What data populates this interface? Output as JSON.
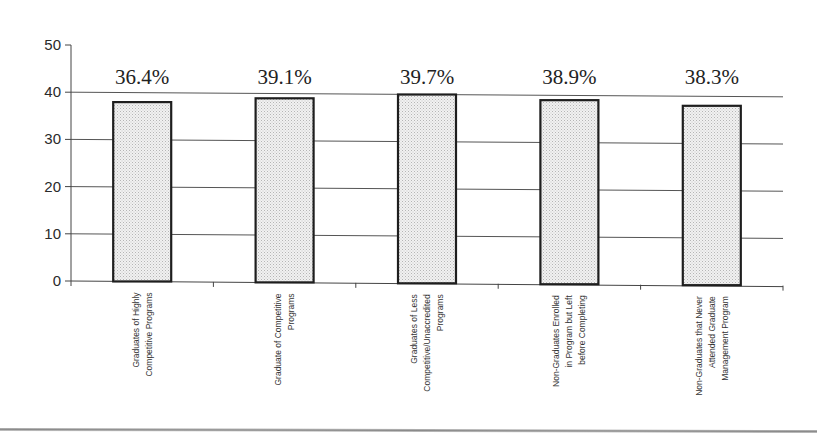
{
  "chart_data": {
    "type": "bar",
    "title": "",
    "xlabel": "",
    "ylabel": "",
    "ylim": [
      0,
      50
    ],
    "yticks": [
      0,
      10,
      20,
      30,
      40,
      50
    ],
    "grid": true,
    "legend": null,
    "categories": [
      "Graduates of Highly Competitive Programs",
      "Graduate of Competitive Programs",
      "Graduates of Less Competitive/Unaccredited Programs",
      "Non-Graduates Enrolled in Program but Left before Completing",
      "Non-Graduates that Never Attended Graduate Management Program"
    ],
    "category_label_lines": [
      [
        "Graduates of Highly",
        "Competitive Programs"
      ],
      [
        "Graduate of Competitive",
        "Programs"
      ],
      [
        "Graduates of Less",
        "Competitive/Unaccredited",
        "Programs"
      ],
      [
        "Non-Graduates Enrolled",
        "in Program but Left",
        "before Completing"
      ],
      [
        "Non-Graduates that Never",
        "Attended Graduate",
        "Management Program"
      ]
    ],
    "values": [
      38,
      39,
      40,
      39,
      38
    ],
    "data_labels": [
      "36.4%",
      "39.1%",
      "39.7%",
      "38.9%",
      "38.3%"
    ],
    "colors": {
      "bar_fill": "#e6e6e6",
      "bar_stroke": "#1e1e1e",
      "grid": "#555555"
    }
  }
}
